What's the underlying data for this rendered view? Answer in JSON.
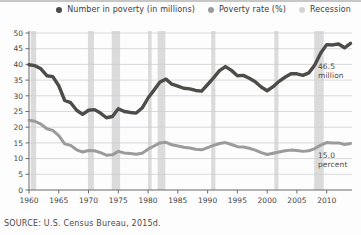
{
  "page": {
    "source_note": "SOURCE: U.S. Census Bureau, 2015d."
  },
  "legend": {
    "items": [
      {
        "name": "number-in-poverty",
        "label": "Number in poverty (in millions)",
        "color": "#4e4c49"
      },
      {
        "name": "poverty-rate",
        "label": "Poverty rate (%)",
        "color": "#9b9b9b"
      },
      {
        "name": "recession",
        "label": "Recession",
        "color": "#d4d4d4"
      }
    ]
  },
  "annotations": {
    "number": "46.5\nmillion",
    "rate": "15.0\npercent"
  },
  "chart_data": {
    "type": "line",
    "title": "",
    "xlabel": "",
    "ylabel": "",
    "xlim": [
      1960,
      2014
    ],
    "ylim": [
      0,
      50
    ],
    "grid": true,
    "legend_position": "top",
    "xticks": [
      1960,
      1965,
      1970,
      1975,
      1980,
      1985,
      1990,
      1995,
      2000,
      2005,
      2010
    ],
    "yticks": [
      0,
      5,
      10,
      15,
      20,
      25,
      30,
      35,
      40,
      45,
      50
    ],
    "x": [
      1960,
      1961,
      1962,
      1963,
      1964,
      1965,
      1966,
      1967,
      1968,
      1969,
      1970,
      1971,
      1972,
      1973,
      1974,
      1975,
      1976,
      1977,
      1978,
      1979,
      1980,
      1981,
      1982,
      1983,
      1984,
      1985,
      1986,
      1987,
      1988,
      1989,
      1990,
      1991,
      1992,
      1993,
      1994,
      1995,
      1996,
      1997,
      1998,
      1999,
      2000,
      2001,
      2002,
      2003,
      2004,
      2005,
      2006,
      2007,
      2008,
      2009,
      2010,
      2011,
      2012,
      2013,
      2014
    ],
    "series": [
      {
        "name": "Number in poverty (in millions)",
        "color": "#4e4c49",
        "values": [
          39.9,
          39.6,
          38.6,
          36.4,
          36.1,
          33.2,
          28.5,
          27.8,
          25.4,
          24.1,
          25.4,
          25.6,
          24.5,
          23.0,
          23.4,
          25.9,
          25.0,
          24.7,
          24.5,
          26.1,
          29.3,
          31.8,
          34.4,
          35.3,
          33.7,
          33.1,
          32.4,
          32.2,
          31.7,
          31.5,
          33.6,
          35.7,
          38.0,
          39.3,
          38.1,
          36.4,
          36.5,
          35.6,
          34.5,
          32.8,
          31.6,
          32.9,
          34.6,
          35.9,
          37.0,
          37.0,
          36.5,
          37.3,
          39.8,
          43.6,
          46.3,
          46.2,
          46.5,
          45.3,
          46.7
        ]
      },
      {
        "name": "Poverty rate (%)",
        "color": "#9b9b9b",
        "values": [
          22.2,
          21.9,
          21.0,
          19.5,
          19.0,
          17.3,
          14.7,
          14.2,
          12.8,
          12.1,
          12.6,
          12.5,
          11.9,
          11.1,
          11.2,
          12.3,
          11.8,
          11.6,
          11.4,
          11.7,
          13.0,
          14.0,
          15.0,
          15.2,
          14.4,
          14.0,
          13.6,
          13.4,
          13.0,
          12.8,
          13.5,
          14.2,
          14.8,
          15.1,
          14.5,
          13.8,
          13.7,
          13.3,
          12.7,
          11.9,
          11.3,
          11.7,
          12.1,
          12.5,
          12.7,
          12.6,
          12.3,
          12.5,
          13.2,
          14.3,
          15.1,
          15.0,
          15.0,
          14.5,
          14.8
        ]
      }
    ],
    "recessions": [
      [
        1960.3,
        1961.2
      ],
      [
        1969.9,
        1970.9
      ],
      [
        1973.9,
        1975.3
      ],
      [
        1980.0,
        1980.6
      ],
      [
        1981.6,
        1982.9
      ],
      [
        1990.6,
        1991.3
      ],
      [
        2001.2,
        2001.9
      ],
      [
        2007.9,
        2009.5
      ]
    ],
    "recession_color": "#dbdbdb",
    "grid_color": "#cccccc",
    "axis_color": "#6b6b6b",
    "tick_label_color": "#454545"
  }
}
